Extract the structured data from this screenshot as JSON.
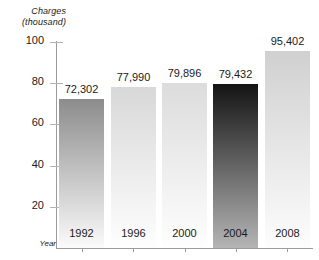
{
  "chart_data": {
    "type": "bar",
    "title": "",
    "xlabel": "Year",
    "ylabel": "Charges (thousand)",
    "ylabel_line1": "Charges",
    "ylabel_line2": "(thousand)",
    "categories": [
      "1992",
      "1996",
      "2000",
      "2004",
      "2008"
    ],
    "values": [
      72302,
      77990,
      79896,
      79432,
      95402
    ],
    "value_labels": [
      "72,302",
      "77,990",
      "79,896",
      "79,432",
      "95,402"
    ],
    "ylim": [
      0,
      100
    ],
    "y_ticks": [
      20,
      40,
      60,
      80,
      100
    ],
    "y_tick_labels": [
      "20",
      "40",
      "60",
      "80",
      "100"
    ],
    "y_unit_scale": "thousand",
    "grid": false,
    "legend": false,
    "bar_colors_top": [
      "#8c8c8c",
      "#d8d8d8",
      "#dcdcdc",
      "#141414",
      "#d0d0d0"
    ],
    "bar_colors_bottom": [
      "#fbfbfb",
      "#fefefe",
      "#fefefe",
      "#b5b5b5",
      "#fdfdfd"
    ],
    "highlight_category": "2004",
    "axis_color": "#9b9b9b",
    "text_color": "#1a1a1a"
  }
}
